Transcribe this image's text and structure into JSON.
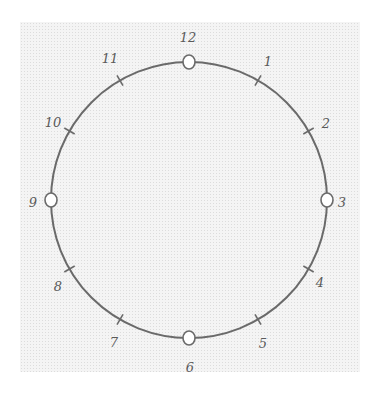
{
  "diagram": {
    "type": "hand-drawn clock face",
    "stroke_color": "#6a6a6a",
    "paper_color": "#f4f4f4",
    "center": [
      189,
      200
    ],
    "radius": 138,
    "hours": [
      {
        "label": "12",
        "marker": "circle",
        "label_pos": [
          188,
          42
        ]
      },
      {
        "label": "1",
        "marker": "tick",
        "label_pos": [
          268,
          66
        ]
      },
      {
        "label": "2",
        "marker": "tick",
        "label_pos": [
          326,
          128
        ]
      },
      {
        "label": "3",
        "marker": "circle",
        "label_pos": [
          342,
          207
        ]
      },
      {
        "label": "4",
        "marker": "tick",
        "label_pos": [
          320,
          287
        ]
      },
      {
        "label": "5",
        "marker": "tick",
        "label_pos": [
          263,
          348
        ]
      },
      {
        "label": "6",
        "marker": "circle",
        "label_pos": [
          190,
          372
        ]
      },
      {
        "label": "7",
        "marker": "tick",
        "label_pos": [
          114,
          347
        ]
      },
      {
        "label": "8",
        "marker": "tick",
        "label_pos": [
          58,
          291
        ]
      },
      {
        "label": "9",
        "marker": "circle",
        "label_pos": [
          33,
          207
        ]
      },
      {
        "label": "10",
        "marker": "tick",
        "label_pos": [
          53,
          127
        ]
      },
      {
        "label": "11",
        "marker": "tick",
        "label_pos": [
          110,
          63
        ]
      }
    ]
  }
}
